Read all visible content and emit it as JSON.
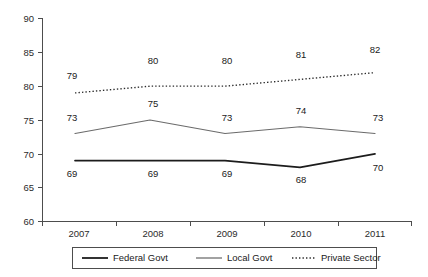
{
  "chart_data": {
    "type": "line",
    "title": "",
    "subtitle": "",
    "xlabel": "",
    "ylabel": "",
    "categories": [
      "2007",
      "2008",
      "2009",
      "2010",
      "2011"
    ],
    "x": [
      2007,
      2008,
      2009,
      2010,
      2011
    ],
    "ylim": [
      60,
      90
    ],
    "yticks": [
      60,
      65,
      70,
      75,
      80,
      85,
      90
    ],
    "ytick_labels": [
      "60",
      "65",
      "70",
      "75",
      "80",
      "85",
      "90"
    ],
    "grid": false,
    "legend_position": "bottom",
    "show_data_labels": true,
    "series": [
      {
        "name": "Federal Govt",
        "style": "solid",
        "color": "#1c1c1c",
        "values": [
          69,
          69,
          69,
          68,
          70
        ],
        "labels": [
          "69",
          "69",
          "69",
          "68",
          "70"
        ]
      },
      {
        "name": "Local Govt",
        "style": "solid",
        "color": "#6b6b6b",
        "values": [
          73,
          75,
          73,
          74,
          73
        ],
        "labels": [
          "73",
          "75",
          "73",
          "74",
          "73"
        ]
      },
      {
        "name": "Private Sector",
        "style": "dotted",
        "color": "#2b2b2b",
        "values": [
          79,
          80,
          80,
          81,
          82
        ],
        "labels": [
          "79",
          "80",
          "80",
          "81",
          "82"
        ]
      }
    ]
  },
  "legend": {
    "items": [
      {
        "label": "Federal Govt"
      },
      {
        "label": "Local Govt"
      },
      {
        "label": "Private Sector"
      }
    ]
  },
  "axes": {
    "y_tick_labels": [
      "90",
      "85",
      "80",
      "75",
      "70",
      "65",
      "60"
    ],
    "x_tick_labels": [
      "2007",
      "2008",
      "2009",
      "2010",
      "2011"
    ]
  }
}
